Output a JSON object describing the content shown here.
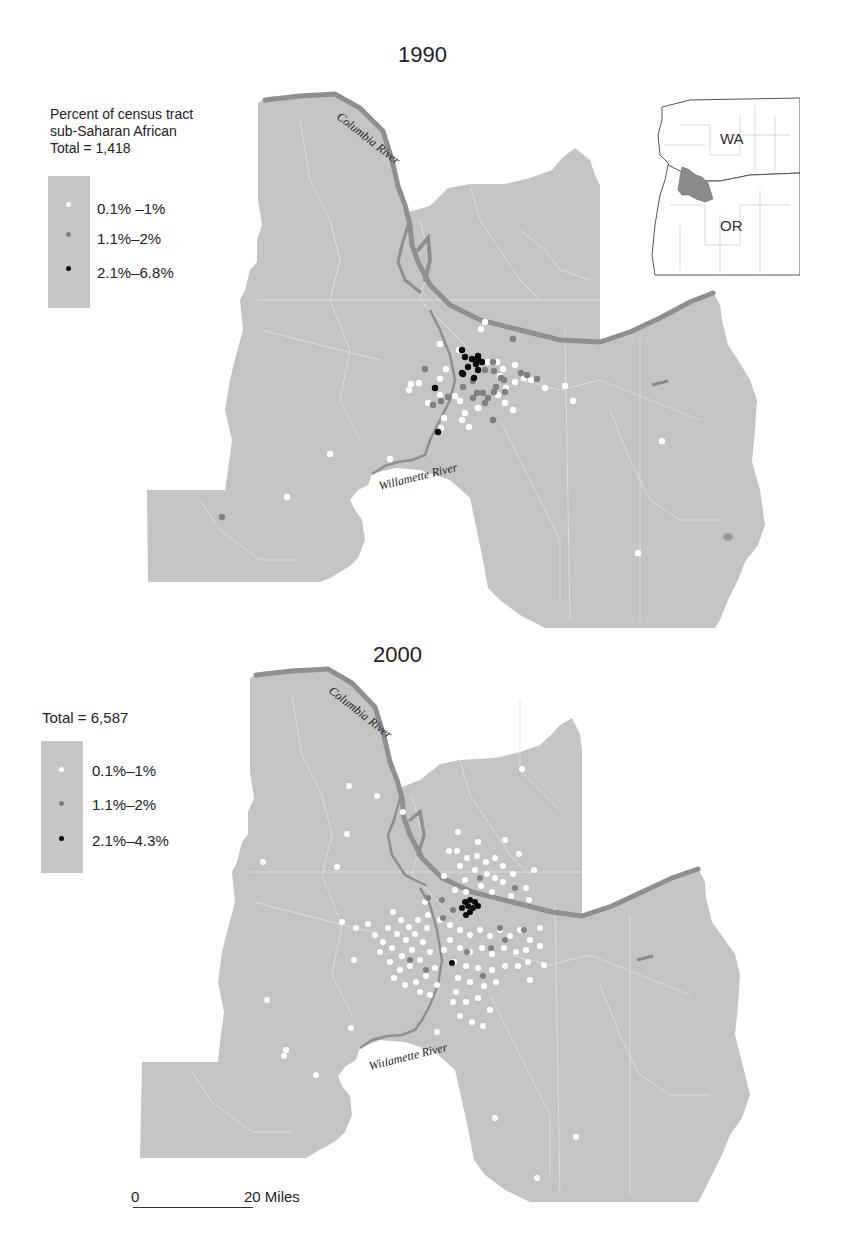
{
  "colors": {
    "land": "#c4c4c4",
    "river": "#8f8f8f",
    "boundary": "#e4e4e4",
    "dot_low": "#ffffff",
    "dot_mid": "#808080",
    "dot_high": "#0a0a0a",
    "inset_highlight": "#8a8a8a"
  },
  "maps": [
    {
      "year": "1990",
      "legend": {
        "heading_line1": "Percent of census tract",
        "heading_line2": "sub-Saharan African",
        "total": "Total = 1,418",
        "classes": [
          {
            "label": "0.1% –1%",
            "color_key": "dot_low"
          },
          {
            "label": "1.1%–2%",
            "color_key": "dot_mid"
          },
          {
            "label": "2.1%–6.8%",
            "color_key": "dot_high"
          }
        ]
      },
      "rivers": [
        "Columbia River",
        "Willamette River"
      ]
    },
    {
      "year": "2000",
      "legend": {
        "total": "Total = 6,587",
        "classes": [
          {
            "label": "0.1%–1%",
            "color_key": "dot_low"
          },
          {
            "label": "1.1%–2%",
            "color_key": "dot_mid"
          },
          {
            "label": "2.1%–4.3%",
            "color_key": "dot_high"
          }
        ]
      },
      "rivers": [
        "Columbia River",
        "Willamette River"
      ]
    }
  ],
  "inset": {
    "state_labels": [
      "WA",
      "OR"
    ]
  },
  "scale_bar": {
    "start": "0",
    "end": "20 Miles"
  },
  "rivers": {
    "columbia": "Columbia River",
    "willamette": "Willamette River"
  }
}
